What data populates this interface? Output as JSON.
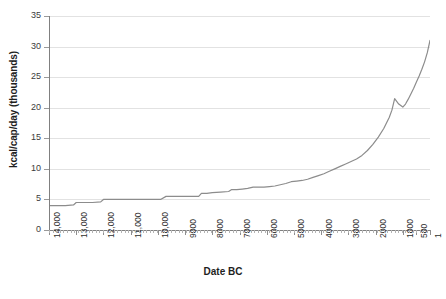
{
  "chart_data": {
    "type": "line",
    "title": "",
    "xlabel": "Date BC",
    "ylabel": "kcal/cap/day (thousands)",
    "x_tick_labels": [
      "14,000",
      "13,000",
      "12,000",
      "11,000",
      "10,000",
      "9000",
      "8000",
      "7000",
      "6000",
      "5000",
      "4000",
      "3000",
      "2000",
      "1000",
      "500",
      "1"
    ],
    "x_tick_values": [
      14000,
      13000,
      12000,
      11000,
      10000,
      9000,
      8000,
      7000,
      6000,
      5000,
      4000,
      3000,
      2000,
      1000,
      500,
      1
    ],
    "x_axis_direction": "reversed",
    "xlim": [
      14000,
      1
    ],
    "y_tick_labels": [
      "0",
      "5",
      "10",
      "15",
      "20",
      "25",
      "30",
      "35"
    ],
    "y_tick_values": [
      0,
      5,
      10,
      15,
      20,
      25,
      30,
      35
    ],
    "ylim": [
      0,
      35
    ],
    "grid": "horizontal",
    "legend": "none",
    "line_color": "#8c8c8c",
    "gridline_color": "#e2e2e2",
    "axis_color": "#808080",
    "background_color": "#ffffff",
    "series": [
      {
        "name": "kcal/cap/day",
        "x": [
          14000,
          13400,
          13100,
          13000,
          12400,
          12100,
          12000,
          11400,
          10600,
          9900,
          9700,
          9400,
          9000,
          8700,
          8500,
          8400,
          8200,
          8000,
          7700,
          7400,
          7300,
          7100,
          6900,
          6700,
          6500,
          6300,
          6100,
          5900,
          5700,
          5500,
          5300,
          5100,
          4900,
          4700,
          4500,
          4300,
          4100,
          3900,
          3700,
          3500,
          3300,
          3100,
          2900,
          2700,
          2500,
          2300,
          2100,
          1900,
          1700,
          1500,
          1400,
          1300,
          1150,
          1000,
          900,
          800,
          700,
          600,
          500,
          400,
          300,
          200,
          100,
          1
        ],
        "y": [
          4.0,
          4.0,
          4.1,
          4.5,
          4.5,
          4.6,
          5.0,
          5.0,
          5.0,
          5.0,
          5.5,
          5.5,
          5.5,
          5.5,
          5.5,
          6.0,
          6.0,
          6.1,
          6.2,
          6.3,
          6.6,
          6.6,
          6.7,
          6.8,
          7.0,
          7.0,
          7.0,
          7.1,
          7.2,
          7.4,
          7.6,
          7.9,
          8.0,
          8.1,
          8.3,
          8.6,
          8.9,
          9.2,
          9.6,
          10.0,
          10.4,
          10.8,
          11.2,
          11.6,
          12.2,
          13.0,
          14.0,
          15.2,
          16.6,
          18.4,
          19.6,
          21.5,
          20.6,
          20.1,
          20.6,
          21.4,
          22.3,
          23.2,
          24.2,
          25.2,
          26.3,
          27.5,
          29.0,
          31.0
        ]
      }
    ]
  }
}
